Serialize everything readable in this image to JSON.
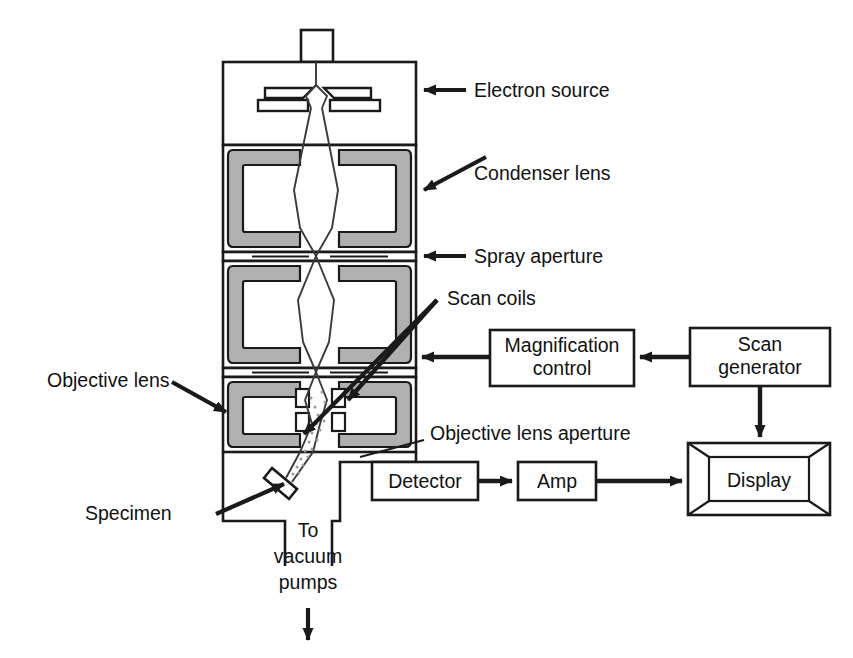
{
  "diagram": {
    "colors": {
      "stroke": "#1a1a1a",
      "pole_piece_fill": "#b0b0b0",
      "background": "#ffffff",
      "beam": "#3a3a3a",
      "scatter_dots": "#8a8a8a"
    },
    "labels": {
      "electron_source": "Electron source",
      "condenser_lens": "Condenser lens",
      "spray_aperture": "Spray aperture",
      "scan_coils": "Scan coils",
      "objective_lens": "Objective lens",
      "objective_lens_aperture": "Objective lens aperture",
      "specimen": "Specimen",
      "vacuum_line_1": "To",
      "vacuum_line_2": "vacuum",
      "vacuum_line_3": "pumps"
    },
    "boxes": {
      "magnification_control_line1": "Magnification",
      "magnification_control_line2": "control",
      "scan_generator_line1": "Scan",
      "scan_generator_line2": "generator",
      "detector": "Detector",
      "amp": "Amp",
      "display": "Display"
    }
  }
}
